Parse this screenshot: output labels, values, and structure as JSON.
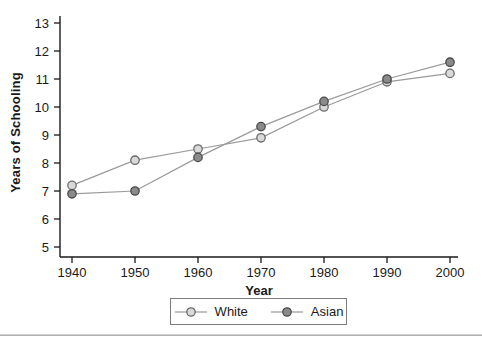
{
  "chart_data": {
    "type": "line",
    "x": [
      1940,
      1950,
      1960,
      1970,
      1980,
      1990,
      2000
    ],
    "series": [
      {
        "name": "White",
        "values": [
          7.2,
          8.1,
          8.5,
          8.9,
          10.0,
          10.9,
          11.2
        ],
        "line_color": "#9a9a9a",
        "marker_fill": "#d9d9d9",
        "marker_stroke": "#6b6b6b"
      },
      {
        "name": "Asian",
        "values": [
          6.9,
          7.0,
          8.2,
          9.3,
          10.2,
          11.0,
          11.6
        ],
        "line_color": "#9a9a9a",
        "marker_fill": "#8a8a8a",
        "marker_stroke": "#4a4a4a"
      }
    ],
    "title": "",
    "xlabel": "Year",
    "ylabel": "Years of Schooling",
    "xlim": [
      1940,
      2000
    ],
    "ylim": [
      5,
      13
    ],
    "xticks": [
      1940,
      1950,
      1960,
      1970,
      1980,
      1990,
      2000
    ],
    "yticks": [
      5,
      6,
      7,
      8,
      9,
      10,
      11,
      12,
      13
    ],
    "grid": false,
    "legend_position": "bottom-center-boxed"
  },
  "colors": {
    "axis": "#1a1a1a",
    "tick_label": "#1a1a1a",
    "legend_border": "#7d7d7d",
    "separator": "#b0b0b0",
    "background": "#ffffff"
  }
}
